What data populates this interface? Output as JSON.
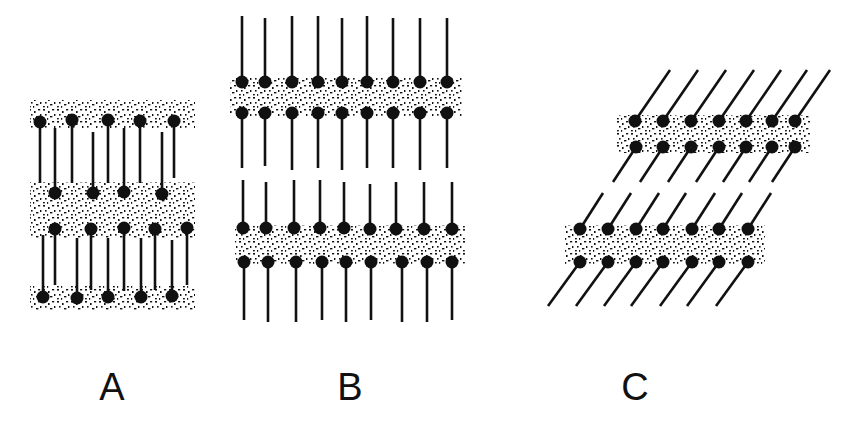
{
  "figure": {
    "panels": [
      {
        "id": "A",
        "label": "A",
        "label_x": 112,
        "label_y": 368,
        "description": "interdigitated lipid layers",
        "bands": [
          {
            "x": 30,
            "y": 100,
            "w": 165,
            "h": 28
          },
          {
            "x": 30,
            "y": 182,
            "w": 165,
            "h": 56
          },
          {
            "x": 30,
            "y": 286,
            "w": 165,
            "h": 24
          }
        ],
        "molecules": [
          {
            "hx": 40,
            "hy": 122,
            "tx": 40,
            "ty": 183
          },
          {
            "hx": 72,
            "hy": 120,
            "tx": 72,
            "ty": 183
          },
          {
            "hx": 108,
            "hy": 120,
            "tx": 108,
            "ty": 183
          },
          {
            "hx": 140,
            "hy": 121,
            "tx": 140,
            "ty": 183
          },
          {
            "hx": 174,
            "hy": 121,
            "tx": 174,
            "ty": 178
          },
          {
            "hx": 55,
            "hy": 193,
            "tx": 55,
            "ty": 128
          },
          {
            "hx": 93,
            "hy": 193,
            "tx": 93,
            "ty": 132
          },
          {
            "hx": 124,
            "hy": 192,
            "tx": 124,
            "ty": 128
          },
          {
            "hx": 162,
            "hy": 194,
            "tx": 162,
            "ty": 132
          },
          {
            "hx": 55,
            "hy": 229,
            "tx": 55,
            "ty": 285
          },
          {
            "hx": 91,
            "hy": 229,
            "tx": 91,
            "ty": 290
          },
          {
            "hx": 124,
            "hy": 228,
            "tx": 124,
            "ty": 291
          },
          {
            "hx": 155,
            "hy": 229,
            "tx": 155,
            "ty": 290
          },
          {
            "hx": 187,
            "hy": 228,
            "tx": 187,
            "ty": 285
          },
          {
            "hx": 43,
            "hy": 297,
            "tx": 43,
            "ty": 235
          },
          {
            "hx": 77,
            "hy": 298,
            "tx": 77,
            "ty": 238
          },
          {
            "hx": 108,
            "hy": 297,
            "tx": 108,
            "ty": 238
          },
          {
            "hx": 141,
            "hy": 297,
            "tx": 141,
            "ty": 238
          },
          {
            "hx": 172,
            "hy": 296,
            "tx": 172,
            "ty": 240
          }
        ]
      },
      {
        "id": "B",
        "label": "B",
        "label_x": 350,
        "label_y": 368,
        "description": "bilayers with extended chains",
        "bands": [
          {
            "x": 230,
            "y": 78,
            "w": 232,
            "h": 38
          },
          {
            "x": 235,
            "y": 225,
            "w": 230,
            "h": 40
          }
        ],
        "molecules": [
          {
            "hx": 242,
            "hy": 82,
            "tx": 242,
            "ty": 16
          },
          {
            "hx": 265,
            "hy": 82,
            "tx": 265,
            "ty": 18
          },
          {
            "hx": 292,
            "hy": 82,
            "tx": 292,
            "ty": 16
          },
          {
            "hx": 318,
            "hy": 82,
            "tx": 318,
            "ty": 16
          },
          {
            "hx": 342,
            "hy": 82,
            "tx": 342,
            "ty": 18
          },
          {
            "hx": 367,
            "hy": 82,
            "tx": 367,
            "ty": 16
          },
          {
            "hx": 393,
            "hy": 82,
            "tx": 393,
            "ty": 18
          },
          {
            "hx": 420,
            "hy": 82,
            "tx": 420,
            "ty": 18
          },
          {
            "hx": 447,
            "hy": 82,
            "tx": 447,
            "ty": 18
          },
          {
            "hx": 242,
            "hy": 113,
            "tx": 242,
            "ty": 168
          },
          {
            "hx": 265,
            "hy": 113,
            "tx": 265,
            "ty": 166
          },
          {
            "hx": 292,
            "hy": 113,
            "tx": 292,
            "ty": 170
          },
          {
            "hx": 318,
            "hy": 113,
            "tx": 318,
            "ty": 168
          },
          {
            "hx": 342,
            "hy": 113,
            "tx": 342,
            "ty": 170
          },
          {
            "hx": 367,
            "hy": 113,
            "tx": 367,
            "ty": 168
          },
          {
            "hx": 393,
            "hy": 113,
            "tx": 393,
            "ty": 168
          },
          {
            "hx": 420,
            "hy": 113,
            "tx": 420,
            "ty": 170
          },
          {
            "hx": 447,
            "hy": 113,
            "tx": 447,
            "ty": 168
          },
          {
            "hx": 243,
            "hy": 228,
            "tx": 243,
            "ty": 180
          },
          {
            "hx": 266,
            "hy": 228,
            "tx": 266,
            "ty": 182
          },
          {
            "hx": 294,
            "hy": 228,
            "tx": 294,
            "ty": 180
          },
          {
            "hx": 320,
            "hy": 228,
            "tx": 320,
            "ty": 180
          },
          {
            "hx": 344,
            "hy": 228,
            "tx": 344,
            "ty": 182
          },
          {
            "hx": 370,
            "hy": 229,
            "tx": 370,
            "ty": 184
          },
          {
            "hx": 396,
            "hy": 229,
            "tx": 396,
            "ty": 182
          },
          {
            "hx": 424,
            "hy": 229,
            "tx": 424,
            "ty": 182
          },
          {
            "hx": 452,
            "hy": 229,
            "tx": 452,
            "ty": 182
          },
          {
            "hx": 244,
            "hy": 262,
            "tx": 244,
            "ty": 320
          },
          {
            "hx": 268,
            "hy": 262,
            "tx": 268,
            "ty": 322
          },
          {
            "hx": 296,
            "hy": 262,
            "tx": 296,
            "ty": 322
          },
          {
            "hx": 322,
            "hy": 262,
            "tx": 322,
            "ty": 320
          },
          {
            "hx": 346,
            "hy": 262,
            "tx": 346,
            "ty": 322
          },
          {
            "hx": 371,
            "hy": 262,
            "tx": 371,
            "ty": 320
          },
          {
            "hx": 402,
            "hy": 262,
            "tx": 402,
            "ty": 322
          },
          {
            "hx": 427,
            "hy": 262,
            "tx": 427,
            "ty": 322
          },
          {
            "hx": 452,
            "hy": 262,
            "tx": 452,
            "ty": 320
          }
        ]
      },
      {
        "id": "C",
        "label": "C",
        "label_x": 635,
        "label_y": 368,
        "description": "tilted chains",
        "bands": [
          {
            "x": 617,
            "y": 115,
            "w": 193,
            "h": 38
          },
          {
            "x": 565,
            "y": 225,
            "w": 200,
            "h": 40
          }
        ],
        "molecules": [
          {
            "hx": 635,
            "hy": 121,
            "tx": 670,
            "ty": 70
          },
          {
            "hx": 663,
            "hy": 121,
            "tx": 698,
            "ty": 70
          },
          {
            "hx": 691,
            "hy": 121,
            "tx": 726,
            "ty": 70
          },
          {
            "hx": 719,
            "hy": 121,
            "tx": 754,
            "ty": 70
          },
          {
            "hx": 746,
            "hy": 121,
            "tx": 781,
            "ty": 70
          },
          {
            "hx": 772,
            "hy": 121,
            "tx": 807,
            "ty": 70
          },
          {
            "hx": 795,
            "hy": 121,
            "tx": 830,
            "ty": 70
          },
          {
            "hx": 636,
            "hy": 147,
            "tx": 613,
            "ty": 182
          },
          {
            "hx": 663,
            "hy": 147,
            "tx": 640,
            "ty": 182
          },
          {
            "hx": 691,
            "hy": 147,
            "tx": 668,
            "ty": 182
          },
          {
            "hx": 719,
            "hy": 147,
            "tx": 696,
            "ty": 182
          },
          {
            "hx": 746,
            "hy": 147,
            "tx": 723,
            "ty": 182
          },
          {
            "hx": 772,
            "hy": 147,
            "tx": 749,
            "ty": 182
          },
          {
            "hx": 795,
            "hy": 147,
            "tx": 772,
            "ty": 182
          },
          {
            "hx": 580,
            "hy": 229,
            "tx": 603,
            "ty": 193
          },
          {
            "hx": 608,
            "hy": 229,
            "tx": 631,
            "ty": 193
          },
          {
            "hx": 636,
            "hy": 229,
            "tx": 659,
            "ty": 193
          },
          {
            "hx": 663,
            "hy": 229,
            "tx": 686,
            "ty": 193
          },
          {
            "hx": 692,
            "hy": 229,
            "tx": 715,
            "ty": 193
          },
          {
            "hx": 719,
            "hy": 229,
            "tx": 742,
            "ty": 193
          },
          {
            "hx": 748,
            "hy": 229,
            "tx": 771,
            "ty": 193
          },
          {
            "hx": 580,
            "hy": 262,
            "tx": 548,
            "ty": 306
          },
          {
            "hx": 608,
            "hy": 262,
            "tx": 576,
            "ty": 306
          },
          {
            "hx": 636,
            "hy": 262,
            "tx": 604,
            "ty": 306
          },
          {
            "hx": 663,
            "hy": 262,
            "tx": 631,
            "ty": 306
          },
          {
            "hx": 692,
            "hy": 262,
            "tx": 660,
            "ty": 306
          },
          {
            "hx": 719,
            "hy": 262,
            "tx": 687,
            "ty": 306
          },
          {
            "hx": 748,
            "hy": 262,
            "tx": 716,
            "ty": 306
          }
        ]
      }
    ],
    "colors": {
      "ink": "#111111",
      "background": "#ffffff"
    }
  }
}
